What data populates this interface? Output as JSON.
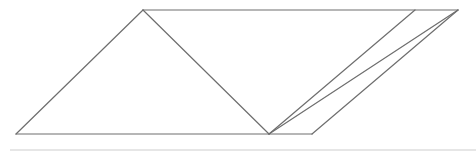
{
  "diagram": {
    "type": "geometric-figure",
    "stroke_color": "#6e6e6e",
    "stroke_width": 1.2,
    "points": {
      "A": [
        16,
        134
      ],
      "B": [
        143,
        10
      ],
      "D": [
        415,
        10
      ],
      "C": [
        458,
        10
      ],
      "E": [
        269,
        134
      ],
      "F": [
        312,
        134
      ]
    },
    "segments": [
      [
        "A",
        "B"
      ],
      [
        "B",
        "C"
      ],
      [
        "A",
        "F"
      ],
      [
        "B",
        "E"
      ],
      [
        "E",
        "D"
      ],
      [
        "E",
        "C"
      ],
      [
        "F",
        "C"
      ]
    ],
    "rule_color": "#e6e6e6"
  }
}
